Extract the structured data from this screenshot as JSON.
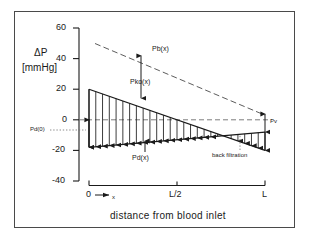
{
  "figure": {
    "frame": true,
    "background": "#ffffff",
    "ink": "#1a1a1a"
  },
  "chart_data": {
    "type": "line",
    "title": "",
    "xlabel": "distance from blood inlet",
    "ylabel": "ΔP [mmHg]",
    "ylabel_line1": "ΔP",
    "ylabel_line2": "[mmHg]",
    "ylim": [
      -40,
      60
    ],
    "yticks": [
      60,
      40,
      20,
      0,
      -20,
      -40
    ],
    "ytick_labels": [
      "60",
      "40",
      "20",
      "0",
      "-20",
      "-40"
    ],
    "xlim": [
      0,
      1
    ],
    "xticks": [
      0,
      0.5,
      1
    ],
    "xtick_labels": [
      "0",
      "L/2",
      "L"
    ],
    "x_origin_label": "0",
    "x_arrow_label": "x",
    "grid": false,
    "legend": "none",
    "zero_line": {
      "value": 0,
      "style": "dashed",
      "label": ""
    },
    "series": [
      {
        "name": "Pb(x)",
        "label": "Pb(x)",
        "style": "dashed",
        "x": [
          0.05,
          1.0
        ],
        "y": [
          50,
          3
        ],
        "comment": "blood side pressure, declines linearly"
      },
      {
        "name": "Pd(x) upper",
        "label": "Pd(x)",
        "style": "solid",
        "x": [
          0.05,
          1.0
        ],
        "y": [
          20,
          -20
        ],
        "comment": "transmembrane pressure envelope top"
      },
      {
        "name": "Pd(x) lower",
        "label": "Pd(x)",
        "style": "solid",
        "x": [
          0.05,
          1.0
        ],
        "y": [
          -18,
          -8
        ],
        "comment": "dialysate side pressure, rises toward outlet"
      }
    ],
    "crossing_point": {
      "x": 0.84,
      "y": -11
    },
    "hatch": {
      "count": 26,
      "direction": "vertical",
      "arrowhead": "down",
      "comment": "filtration flux arrows between Pd upper and lower lines"
    },
    "annotations": [
      {
        "name": "pb-label",
        "text": "Pb(x)",
        "x": 0.38,
        "y": 42
      },
      {
        "name": "pko-label",
        "text": "Pko(x)",
        "x": 0.27,
        "y": 25
      },
      {
        "name": "pd0-label",
        "text": "Pd(0)",
        "x": -0.22,
        "y": -13
      },
      {
        "name": "pv-label",
        "text": "Pv",
        "x": 1.06,
        "y": 2
      },
      {
        "name": "pdx-label",
        "text": "Pd(x)",
        "x": 0.36,
        "y": -30
      },
      {
        "name": "back-filtration-label",
        "text": "back filtration",
        "x": 0.76,
        "y": -32
      }
    ],
    "arrows": [
      {
        "name": "pko-arrow",
        "x": 0.29,
        "y0": 46,
        "y1": 14,
        "heads": "both"
      },
      {
        "name": "pd0-arrow",
        "x": 0.05,
        "y0": 0,
        "y1": -18,
        "heads": "both"
      },
      {
        "name": "pv-arrow",
        "x": 1.0,
        "y0": 3,
        "y1": -9,
        "heads": "both"
      }
    ]
  }
}
